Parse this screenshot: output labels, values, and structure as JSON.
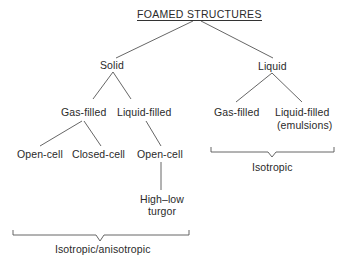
{
  "diagram": {
    "title": "FOAMED STRUCTURES",
    "level1": {
      "solid": "Solid",
      "liquid": "Liquid"
    },
    "level2": {
      "solid_gas_filled": "Gas-filled",
      "solid_liquid_filled": "Liquid-filled",
      "liquid_gas_filled": "Gas-filled",
      "liquid_liquid_filled_line1": "Liquid-filled",
      "liquid_liquid_filled_line2": "(emulsions)"
    },
    "level3": {
      "gas_open_cell": "Open-cell",
      "gas_closed_cell": "Closed-cell",
      "liquid_open_cell": "Open-cell"
    },
    "level4": {
      "turgor_line1": "High–low",
      "turgor_line2": "turgor"
    },
    "brackets": {
      "solid_bracket_label": "Isotropic/anisotropic",
      "liquid_bracket_label": "Isotropic"
    }
  }
}
